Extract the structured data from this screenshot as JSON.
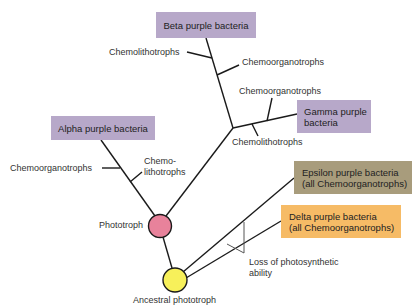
{
  "diagram": {
    "taxa": {
      "beta": "Beta purple bacteria",
      "gamma_line1": "Gamma purple",
      "gamma_line2": "bacteria",
      "alpha": "Alpha purple bacteria",
      "epsilon_line1": "Epsilon purple bacteria",
      "epsilon_line2": "(all Chemoorganotrophs)",
      "delta_line1": "Delta purple bacteria",
      "delta_line2": "(all Chemoorganotrophs)"
    },
    "branch_labels": {
      "beta_chemolithotrophs": "Chemolithotrophs",
      "beta_chemoorganotrophs": "Chemoorganotrophs",
      "gamma_chemoorganotrophs": "Chemoorganotrophs",
      "gamma_chemolithotrophs": "Chemolithotrophs",
      "alpha_chemoorganotrophs": "Chemoorganotrophs",
      "alpha_chemolithotrophs_line1": "Chemo-",
      "alpha_chemolithotrophs_line2": "lithotrophs"
    },
    "nodes": {
      "phototroph": "Phototroph",
      "ancestral": "Ancestral phototroph"
    },
    "annotation": {
      "loss_line1": "Loss of photosynthetic",
      "loss_line2": "ability"
    },
    "colors": {
      "purple_box": "#b7a8c9",
      "epsilon_box": "#a89c7c",
      "delta_box": "#f6bb66",
      "phototroph_node": "#e8829b",
      "ancestral_node": "#f7f05a"
    }
  }
}
